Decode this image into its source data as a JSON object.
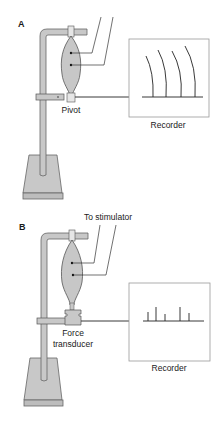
{
  "panels": [
    {
      "id": "A",
      "label": "A",
      "pivot_label": "Pivot",
      "recorder_label": "Recorder",
      "recording_type": "isotonic arcs",
      "arc_count": 4
    },
    {
      "id": "B",
      "label": "B",
      "stimulator_label": "To stimulator",
      "transducer_label_line1": "Force",
      "transducer_label_line2": "transducer",
      "recorder_label": "Recorder",
      "recording_type": "isometric spikes",
      "spike_heights": [
        9,
        14,
        7,
        14,
        8
      ]
    }
  ],
  "colors": {
    "stand_fill": "#c8c8c8",
    "stand_stroke": "#555555",
    "muscle_fill": "#d4d4d4",
    "line": "#222222",
    "recorder_border": "#999999"
  }
}
